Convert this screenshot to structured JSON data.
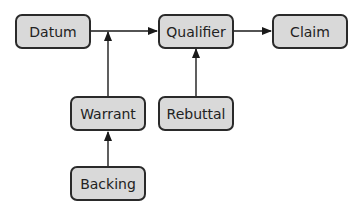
{
  "diagram": {
    "type": "flowchart",
    "nodes": {
      "datum": {
        "label": "Datum"
      },
      "qualifier": {
        "label": "Qualifier"
      },
      "claim": {
        "label": "Claim"
      },
      "warrant": {
        "label": "Warrant"
      },
      "rebuttal": {
        "label": "Rebuttal"
      },
      "backing": {
        "label": "Backing"
      }
    },
    "edges": [
      {
        "from": "Datum",
        "to": "Qualifier"
      },
      {
        "from": "Warrant",
        "to": "Datum-Qualifier link"
      },
      {
        "from": "Qualifier",
        "to": "Claim"
      },
      {
        "from": "Rebuttal",
        "to": "Qualifier"
      },
      {
        "from": "Backing",
        "to": "Warrant"
      }
    ],
    "colors": {
      "node_fill": "#d9d9d9",
      "node_border": "#2a2a2a",
      "line": "#1a1a1a"
    }
  }
}
